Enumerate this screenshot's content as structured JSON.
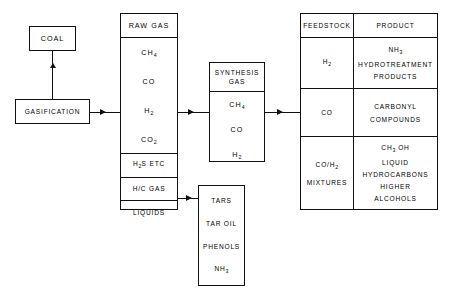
{
  "diagram": {
    "line_color": "#111111",
    "background": "#ffffff"
  },
  "coal_box": {
    "label": "COAL"
  },
  "gasification_box": {
    "label": "GASIFICATION"
  },
  "raw_gas_box": {
    "header": "RAW GAS",
    "components": [
      "CH4",
      "CO",
      "H2",
      "CO2"
    ],
    "components_display": [
      {
        "base": "CH",
        "sub": "4"
      },
      {
        "base": "CO",
        "sub": ""
      },
      {
        "base": "H",
        "sub": "2"
      },
      {
        "base": "CO",
        "sub": "2"
      }
    ],
    "streams": [
      {
        "base": "H",
        "sub": "2",
        "tail": "S  ETC"
      },
      {
        "base": "H/C  GAS",
        "sub": "",
        "tail": ""
      },
      {
        "base": "LIQUIDS",
        "sub": "",
        "tail": ""
      }
    ]
  },
  "synthesis_gas_box": {
    "header_line1": "SYNTHESIS",
    "header_line2": "GAS",
    "components_display": [
      {
        "base": "CH",
        "sub": "4"
      },
      {
        "base": "CO",
        "sub": ""
      },
      {
        "base": "H",
        "sub": "2"
      }
    ]
  },
  "tars_box": {
    "items": [
      "TARS",
      "TAR OIL",
      "PHENOLS",
      "NH3"
    ],
    "items_display": [
      {
        "base": "TARS",
        "sub": ""
      },
      {
        "base": "TAR OIL",
        "sub": ""
      },
      {
        "base": "PHENOLS",
        "sub": ""
      },
      {
        "base": "NH",
        "sub": "3"
      }
    ]
  },
  "feedstock_table": {
    "headers": {
      "feedstock": "FEEDSTOCK",
      "product": "PRODUCT"
    },
    "rows": [
      {
        "feedstock_display": [
          {
            "base": "H",
            "sub": "2"
          }
        ],
        "product_display": [
          {
            "base": "NH",
            "sub": "3"
          },
          {
            "base": "HYDROTREATMENT",
            "sub": ""
          },
          {
            "base": "PRODUCTS",
            "sub": ""
          }
        ]
      },
      {
        "feedstock_display": [
          {
            "base": "CO",
            "sub": ""
          }
        ],
        "product_display": [
          {
            "base": "CARBONYL",
            "sub": ""
          },
          {
            "base": "COMPOUNDS",
            "sub": ""
          }
        ]
      },
      {
        "feedstock_display": [
          {
            "base": "CO/H",
            "sub": "2"
          },
          {
            "base": "MIXTURES",
            "sub": ""
          }
        ],
        "product_display": [
          {
            "base": "CH",
            "sub": "3",
            "tail": " OH"
          },
          {
            "base": "LIQUID",
            "sub": ""
          },
          {
            "base": "HYDROCARBONS",
            "sub": ""
          },
          {
            "base": "HIGHER",
            "sub": ""
          },
          {
            "base": "ALCOHOLS",
            "sub": ""
          }
        ]
      }
    ]
  },
  "connectors": [
    {
      "name": "gasification-to-coal",
      "direction": "up"
    },
    {
      "name": "gasification-to-raw-gas",
      "direction": "right"
    },
    {
      "name": "raw-gas-to-synthesis-gas",
      "direction": "right"
    },
    {
      "name": "synthesis-gas-to-feedstock-table",
      "direction": "right"
    },
    {
      "name": "liquids-to-tars",
      "direction": "right"
    }
  ]
}
